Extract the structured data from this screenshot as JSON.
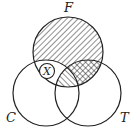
{
  "diagram": {
    "type": "venn",
    "sets": [
      {
        "label": "F",
        "cx": 68,
        "cy": 52,
        "r": 35
      },
      {
        "label": "C",
        "cx": 46,
        "cy": 93,
        "r": 33
      },
      {
        "label": "T",
        "cx": 88,
        "cy": 93,
        "r": 33
      }
    ],
    "regions": [
      {
        "region": "F only",
        "shading": "diagonal-forward"
      },
      {
        "region": "F∩C not T",
        "shading": "none",
        "marker": "X"
      },
      {
        "region": "F∩C∩T",
        "shading": "diagonal-back"
      },
      {
        "region": "F∩T not C",
        "shading": "cross-hatch"
      }
    ],
    "marker_label": "X",
    "line_color": "#222222"
  }
}
